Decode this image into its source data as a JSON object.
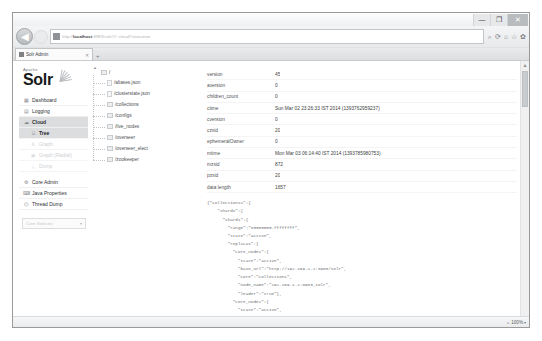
{
  "window": {
    "minimize_label": "—",
    "maximize_label": "❐",
    "close_label": "✕"
  },
  "browser": {
    "back_icon": "back-arrow-icon",
    "back_label": "◀",
    "forward_label": "▶",
    "url_prefix": "http://",
    "url_host": "localhost",
    "url_suffix": ":8983/solr/#/~cloud?view=tree",
    "url_placeholder": "Search or enter address",
    "nav_icons": [
      "search-icon",
      "refresh-icon",
      "home-icon",
      "star-icon",
      "gear-icon"
    ],
    "refresh_glyph": "⟳",
    "search_glyph": "⌕",
    "home_glyph": "⌂",
    "star_glyph": "☆",
    "gear_glyph": "✿",
    "tab": {
      "title": "Solr Admin",
      "close_label": "✕"
    },
    "new_tab_label": "+",
    "zoom_level": "100%",
    "zoom_caret": "▾"
  },
  "sidebar": {
    "logo_top": "Apache",
    "logo_main": "Solr",
    "items": [
      {
        "label": "Dashboard",
        "icon": "dashboard-icon",
        "glyph": "▦",
        "state": "normal"
      },
      {
        "label": "Logging",
        "icon": "logging-icon",
        "glyph": "▤",
        "state": "normal"
      },
      {
        "label": "Cloud",
        "icon": "cloud-icon",
        "glyph": "☁",
        "state": "active"
      }
    ],
    "cloud_subitems": [
      {
        "label": "Tree",
        "icon": "tree-icon",
        "glyph": "⌸",
        "state": "current"
      },
      {
        "label": "Graph",
        "icon": "graph-icon",
        "glyph": "⋔",
        "state": "faded"
      },
      {
        "label": "Graph (Radial)",
        "icon": "radial-graph-icon",
        "glyph": "◉",
        "state": "faded"
      },
      {
        "label": "Dump",
        "icon": "dump-icon",
        "glyph": "⤓",
        "state": "faded"
      }
    ],
    "items2": [
      {
        "label": "Core Admin",
        "icon": "core-admin-icon",
        "glyph": "⚙",
        "state": "normal"
      },
      {
        "label": "Java Properties",
        "icon": "java-properties-icon",
        "glyph": "⌨",
        "state": "normal"
      },
      {
        "label": "Thread Dump",
        "icon": "thread-dump-icon",
        "glyph": "⌬",
        "state": "normal"
      }
    ],
    "core_selector": {
      "label": "Core Selector",
      "caret": "▾"
    }
  },
  "tree": {
    "scroll_up_glyph": "▲",
    "root_label": "/",
    "nodes": [
      {
        "label": "/aliases.json",
        "type": "file"
      },
      {
        "label": "/clusterstate.json",
        "type": "file"
      },
      {
        "label": "/collections",
        "type": "folder"
      },
      {
        "label": "/configs",
        "type": "folder"
      },
      {
        "label": "/live_nodes",
        "type": "folder"
      },
      {
        "label": "/overseer",
        "type": "folder"
      },
      {
        "label": "/overseer_elect",
        "type": "folder"
      },
      {
        "label": "/zookeeper",
        "type": "folder"
      }
    ]
  },
  "detail": {
    "properties": [
      {
        "key": "version",
        "value": "45"
      },
      {
        "key": "aversion",
        "value": "0"
      },
      {
        "key": "children_count",
        "value": "0"
      },
      {
        "key": "ctime",
        "value": "Sun Mar 02 23:26:33 IST 2014 (1393762959237)"
      },
      {
        "key": "cversion",
        "value": "0"
      },
      {
        "key": "czxid",
        "value": "20"
      },
      {
        "key": "ephemeralOwner",
        "value": "0"
      },
      {
        "key": "mtime",
        "value": "Mon Mar 03 06:14:40 IST 2014 (1393785980753)"
      },
      {
        "key": "mzxid",
        "value": "872"
      },
      {
        "key": "pzxid",
        "value": "20"
      },
      {
        "key": "data length",
        "value": "1657"
      }
    ],
    "json_text": "{\"collections1\":{\n    \"shards\":{\n      \"shard1\":{\n        \"range\":\"80000000-ffffffff\",\n        \"state\":\"active\",\n        \"replicas\":{\n          \"core_node1\":{\n            \"state\":\"active\",\n            \"base_url\":\"http://192.169.1.2:8983/solr\",\n            \"core\":\"collection1\",\n            \"node_name\":\"192.169.1.2:8983_solr\",\n            \"leader\":\"true\"},\n          \"core_node2\":{\n            \"state\":\"active\",\n            \"base_url\":\"http://192.169.1.2:8984/solr\",\n            \"core\":\"collection1\",\n            \"node_name\":\"192.169.1.2:8984_solr\"}}},\n       ...",
    "scroll_thumb": "json-scroll-thumb"
  }
}
